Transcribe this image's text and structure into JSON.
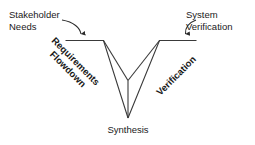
{
  "diagram": {
    "type": "vee-process-diagram",
    "background_color": "#ffffff",
    "line_color": "#3a3a3a",
    "text_color": "#1a1a1a",
    "labels": {
      "stakeholder_needs": "Stakeholder\nNeeds",
      "system_verification": "System\nVerification",
      "requirements_flowdown": "Requirements\nFlowdown",
      "verification": "Verification",
      "synthesis": "Synthesis"
    },
    "annotations": {
      "left_arrow": "curved-arrow-down-to-left-arm",
      "right_arrow": "curved-arrow-down-to-right-arm"
    }
  }
}
